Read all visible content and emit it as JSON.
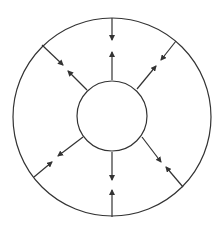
{
  "diagram": {
    "stroke_color": "#333333",
    "background": "#ffffff",
    "outer_circle": {
      "cx": 112,
      "cy": 117,
      "r": 99
    },
    "inner_circle": {
      "cx": 112,
      "cy": 116,
      "r": 35
    },
    "arrows": [
      {
        "name": "top-inward",
        "x1": 112,
        "y1": 18,
        "x2": 112,
        "y2": 40
      },
      {
        "name": "top-outward",
        "x1": 112,
        "y1": 80,
        "x2": 112,
        "y2": 52
      },
      {
        "name": "upper-right-inward",
        "x1": 176,
        "y1": 41,
        "x2": 161,
        "y2": 60
      },
      {
        "name": "upper-right-outward",
        "x1": 137,
        "y1": 89,
        "x2": 156,
        "y2": 66
      },
      {
        "name": "upper-left-inward",
        "x1": 42,
        "y1": 45,
        "x2": 63,
        "y2": 65
      },
      {
        "name": "upper-left-outward",
        "x1": 87,
        "y1": 90,
        "x2": 68,
        "y2": 71
      },
      {
        "name": "lower-left-outward",
        "x1": 83,
        "y1": 137,
        "x2": 58,
        "y2": 156
      },
      {
        "name": "lower-left-inward",
        "x1": 34,
        "y1": 177,
        "x2": 52,
        "y2": 162
      },
      {
        "name": "bottom-outward",
        "x1": 112,
        "y1": 152,
        "x2": 112,
        "y2": 180
      },
      {
        "name": "bottom-inward",
        "x1": 112,
        "y1": 217,
        "x2": 112,
        "y2": 190
      },
      {
        "name": "lower-right-outward",
        "x1": 142,
        "y1": 137,
        "x2": 161,
        "y2": 162
      },
      {
        "name": "lower-right-inward",
        "x1": 183,
        "y1": 187,
        "x2": 166,
        "y2": 167
      }
    ]
  }
}
